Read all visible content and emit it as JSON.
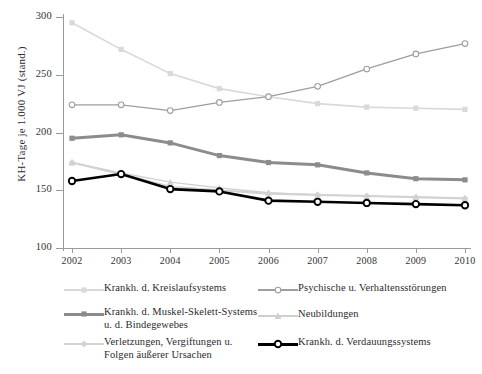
{
  "chart_data": {
    "type": "line",
    "title": "",
    "xlabel": "",
    "ylabel": "KH-Tage je 1.000 VJ (stand.)",
    "categories": [
      "2002",
      "2003",
      "2004",
      "2005",
      "2006",
      "2007",
      "2008",
      "2009",
      "2010"
    ],
    "x": [
      2002,
      2003,
      2004,
      2005,
      2006,
      2007,
      2008,
      2009,
      2010
    ],
    "xlim": [
      2002,
      2010
    ],
    "ylim": [
      100,
      300
    ],
    "yticks": [
      100,
      150,
      200,
      250,
      300
    ],
    "xticks": [
      "2002",
      "2003",
      "2004",
      "2005",
      "2006",
      "2007",
      "2008",
      "2009",
      "2010"
    ],
    "grid": false,
    "legend_position": "below",
    "series": [
      {
        "name": "Krankh. d. Kreislaufsystems",
        "color": "#d9d9d9",
        "marker": "square",
        "width": 1.6,
        "values": [
          295,
          272,
          251,
          238,
          231,
          225,
          222,
          221,
          220
        ]
      },
      {
        "name": "Psychische u. Verhaltensstörungen",
        "color": "#9e9e9e",
        "marker": "open-circle",
        "width": 1.3,
        "values": [
          224,
          224,
          219,
          226,
          231,
          240,
          255,
          268,
          277
        ]
      },
      {
        "name": "Krankh. d. Muskel-Skelett-Systems\nu. d. Bindegewebes",
        "color": "#8c8c8c",
        "marker": "square",
        "width": 3.0,
        "values": [
          195,
          198,
          191,
          180,
          174,
          172,
          165,
          160,
          159
        ]
      },
      {
        "name": "Neubildungen",
        "color": "#cfcfcf",
        "marker": "triangle",
        "width": 1.3,
        "values": [
          174,
          165,
          157,
          152,
          148,
          146,
          145,
          144,
          143
        ]
      },
      {
        "name": "Verletzungen, Vergiftungen u.\nFolgen äußerer Ursachen",
        "color": "#d2d2d2",
        "marker": "diamond",
        "width": 2.2,
        "values": [
          174,
          164,
          153,
          150,
          147,
          146,
          145,
          144,
          143
        ]
      },
      {
        "name": "Krankh. d. Verdauungssystems",
        "color": "#000000",
        "marker": "open-circle-black",
        "width": 2.6,
        "values": [
          158,
          164,
          151,
          149,
          141,
          140,
          139,
          138,
          137
        ]
      }
    ]
  },
  "legend": {
    "entries": [
      {
        "label": "Krankh. d. Kreislaufsystems",
        "series": 0
      },
      {
        "label": "Psychische u. Verhaltensstörungen",
        "series": 1
      },
      {
        "label": "Krankh. d. Muskel-Skelett-Systems\nu. d. Bindegewebes",
        "series": 2
      },
      {
        "label": "Neubildungen",
        "series": 3
      },
      {
        "label": "Verletzungen, Vergiftungen u.\nFolgen äußerer Ursachen",
        "series": 4
      },
      {
        "label": "Krankh. d. Verdauungssystems",
        "series": 5
      }
    ]
  }
}
